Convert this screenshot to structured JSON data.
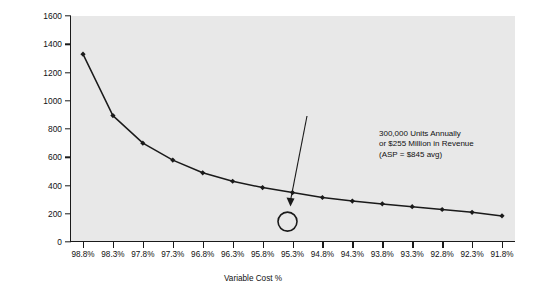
{
  "chart_data": {
    "type": "line",
    "title": "",
    "xlabel": "Variable Cost %",
    "ylabel": "Revenue/Year($M)",
    "categories": [
      "98.8%",
      "98.3%",
      "97.8%",
      "97.3%",
      "96.8%",
      "96.3%",
      "95.8%",
      "95.3%",
      "94.8%",
      "94.3%",
      "93.8%",
      "93.3%",
      "92.8%",
      "92.3%",
      "91.8%"
    ],
    "x": [
      98.8,
      98.3,
      97.8,
      97.3,
      96.8,
      96.3,
      95.8,
      95.3,
      94.8,
      94.3,
      93.8,
      93.3,
      92.8,
      92.3,
      91.8
    ],
    "values": [
      1330,
      895,
      700,
      580,
      490,
      430,
      385,
      350,
      315,
      290,
      270,
      250,
      230,
      210,
      185
    ],
    "ylim": [
      0,
      1600
    ],
    "yticks": [
      0,
      200,
      400,
      600,
      800,
      1000,
      1200,
      1400,
      1600
    ],
    "ytick_labels": [
      "0",
      "200",
      "400",
      "600",
      "800",
      "1000",
      "1200",
      "1400",
      "1600"
    ],
    "grid": false,
    "legend": "none",
    "marker": "filled-diamond",
    "line_color": "#1a1a1a",
    "plot_background": "#e8e8e8",
    "annotations": [
      {
        "name": "units-revenue-callout",
        "lines": [
          "300,000 Units Annually",
          "or $255 Million in Revenue",
          "(ASP = $845 avg)"
        ],
        "pointer": "arrow-to-circle",
        "target_x": "95.3%",
        "target_marker": "open-circle"
      }
    ]
  }
}
